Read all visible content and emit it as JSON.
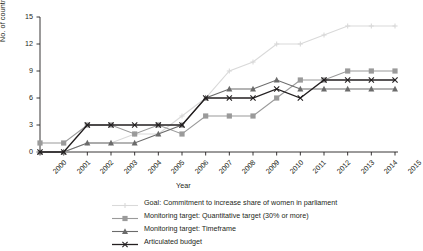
{
  "chart_data": {
    "type": "line",
    "title": "",
    "xlabel": "Year",
    "ylabel": "No. of countries",
    "categories": [
      "2000",
      "2001",
      "2002",
      "2003",
      "2004",
      "2005",
      "2006",
      "2007",
      "2008",
      "2009",
      "2010",
      "2011",
      "2012",
      "2013",
      "2014",
      "2015"
    ],
    "ylim": [
      0,
      15
    ],
    "yticks": [
      0,
      3,
      6,
      9,
      12,
      15
    ],
    "grid": false,
    "legend_position": "bottom",
    "series": [
      {
        "name": "Goal: Commitment to increase share of women in parliament",
        "color": "#d9d9d9",
        "marker": "plus",
        "values": [
          0,
          0,
          1,
          1,
          2,
          2,
          4,
          6,
          9,
          10,
          12,
          12,
          13,
          14,
          14,
          14
        ]
      },
      {
        "name": "Monitoring target: Quantitative target (30% or more)",
        "color": "#9a9a9a",
        "marker": "square",
        "values": [
          1,
          1,
          3,
          3,
          2,
          3,
          2,
          4,
          4,
          4,
          6,
          8,
          8,
          9,
          9,
          9
        ]
      },
      {
        "name": "Monitoring target: Timeframe",
        "color": "#6b6b6b",
        "marker": "triangle",
        "values": [
          0,
          0,
          1,
          1,
          1,
          2,
          3,
          6,
          7,
          7,
          8,
          7,
          7,
          7,
          7,
          7
        ]
      },
      {
        "name": "Articulated budget",
        "color": "#231f20",
        "marker": "x",
        "values": [
          0,
          0,
          3,
          3,
          3,
          3,
          3,
          6,
          6,
          6,
          7,
          6,
          8,
          8,
          8,
          8
        ]
      }
    ]
  }
}
